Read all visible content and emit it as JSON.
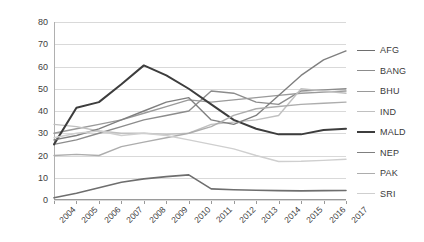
{
  "chart_data": {
    "type": "line",
    "title": "",
    "xlabel": "",
    "ylabel": "",
    "x": [
      "2004",
      "2005",
      "2006",
      "2007",
      "2008",
      "2009",
      "2010",
      "2011",
      "2012",
      "2013",
      "2014",
      "2015",
      "2016",
      "2017"
    ],
    "ylim": [
      0,
      80
    ],
    "yticks": [
      0,
      10,
      20,
      30,
      40,
      50,
      60,
      70,
      80
    ],
    "grid": true,
    "legend_position": "right",
    "series": [
      {
        "name": "AFG",
        "color": "#6e6e6e",
        "width": 1.6,
        "values": [
          1,
          3,
          5.5,
          8,
          9.5,
          10.5,
          11.3,
          5,
          4.6,
          4.4,
          4.2,
          4.1,
          4.2,
          4.3
        ]
      },
      {
        "name": "BANG",
        "color": "#8c8c8c",
        "width": 1.4,
        "values": [
          25,
          27,
          30,
          33,
          36,
          38,
          40,
          49,
          48,
          44,
          43,
          49,
          49.5,
          50
        ]
      },
      {
        "name": "BHU",
        "color": "#9a9a9a",
        "width": 1.4,
        "values": [
          30,
          32,
          34,
          36,
          39,
          42,
          45,
          44,
          45,
          46,
          47,
          48,
          48.5,
          49
        ]
      },
      {
        "name": "IND",
        "color": "#c0c0c0",
        "width": 1.4,
        "values": [
          34,
          33,
          31,
          30,
          30,
          29.5,
          30,
          34,
          35,
          36,
          38,
          50,
          49,
          48
        ]
      },
      {
        "name": "MALD",
        "color": "#3d3d3d",
        "width": 2.0,
        "values": [
          25,
          41.5,
          44,
          52,
          60.5,
          56,
          50,
          43,
          36,
          32,
          29.5,
          29.5,
          31.5,
          32
        ]
      },
      {
        "name": "NEP",
        "color": "#7f7f7f",
        "width": 1.4,
        "values": [
          27,
          29,
          32,
          36,
          40,
          44,
          46,
          36,
          34,
          38,
          47,
          56,
          63,
          67
        ]
      },
      {
        "name": "PAK",
        "color": "#adadad",
        "width": 1.4,
        "values": [
          20,
          20.5,
          20,
          24,
          26,
          28,
          30,
          33,
          38,
          41,
          42,
          43,
          43.5,
          44
        ]
      },
      {
        "name": "SRI",
        "color": "#cfcfcf",
        "width": 1.4,
        "values": [
          28,
          30,
          31,
          29,
          30,
          29,
          27,
          25,
          23,
          20,
          17.3,
          17.4,
          17.8,
          18.3
        ]
      }
    ]
  }
}
